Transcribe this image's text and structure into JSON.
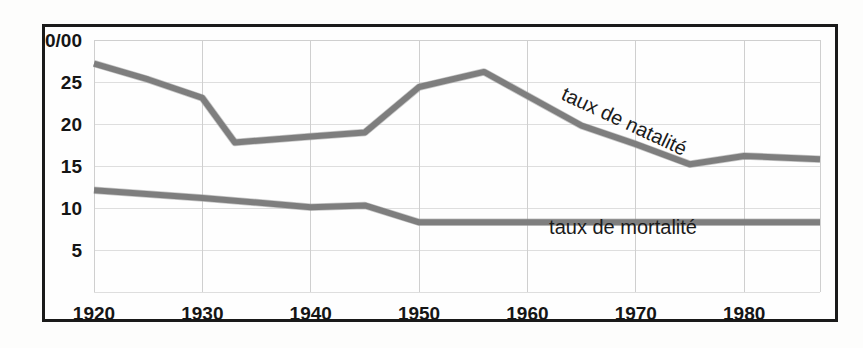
{
  "chart_data": {
    "type": "line",
    "title": "",
    "subtitle": "",
    "xlabel": "",
    "ylabel": "",
    "unit_label": "0/00",
    "xlim": [
      1920,
      1987
    ],
    "ylim": [
      0,
      30
    ],
    "xticks": [
      1920,
      1930,
      1940,
      1950,
      1960,
      1970,
      1980
    ],
    "xtick_labels": [
      "1920",
      "1930",
      "1940",
      "1950",
      "1960",
      "1970",
      "1980"
    ],
    "yticks": [
      5,
      10,
      15,
      20,
      25
    ],
    "ytick_labels": [
      "5",
      "10",
      "15",
      "20",
      "25"
    ],
    "gridlines_y": [
      5,
      10,
      15,
      20,
      25,
      30
    ],
    "gridlines_x": [
      1920,
      1930,
      1940,
      1950,
      1960,
      1970,
      1980
    ],
    "grid": true,
    "legend_position": "inline-annotations",
    "series": [
      {
        "name": "taux de natalité",
        "label": "taux de natalité",
        "color": "#7e7e7e",
        "label_rotation_deg": 25,
        "label_anchor_x": 1963,
        "label_anchor_y": 23.0,
        "x": [
          1920,
          1925,
          1930,
          1933,
          1940,
          1945,
          1950,
          1956,
          1965,
          1970,
          1975,
          1980,
          1987
        ],
        "y": [
          27.2,
          25.3,
          23.1,
          17.8,
          18.5,
          19.0,
          24.4,
          26.2,
          19.8,
          17.6,
          15.2,
          16.2,
          15.8
        ]
      },
      {
        "name": "taux de mortalité",
        "label": "taux de mortalité",
        "color": "#7e7e7e",
        "label_rotation_deg": 0,
        "label_anchor_x": 1962,
        "label_anchor_y": 6.9,
        "x": [
          1920,
          1930,
          1940,
          1945,
          1950,
          1960,
          1970,
          1980,
          1987
        ],
        "y": [
          12.1,
          11.2,
          10.1,
          10.3,
          8.3,
          8.3,
          8.3,
          8.3,
          8.3
        ]
      }
    ],
    "annotations": [
      {
        "text": "taux de natalité",
        "x": 1963,
        "y": 23.0,
        "rotation": 25
      },
      {
        "text": "taux de mortalité",
        "x": 1962,
        "y": 6.9,
        "rotation": 0
      }
    ],
    "colors": {
      "line": "#7e7e7e",
      "grid": "#cfcfcf",
      "frame": "#1a1a1a",
      "text": "#151515",
      "background": "#fefefe"
    }
  }
}
